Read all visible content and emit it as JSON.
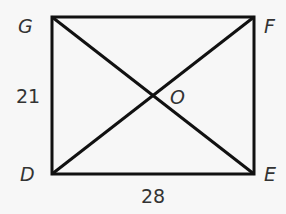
{
  "figure": {
    "type": "rectangle-with-diagonals",
    "vertices": {
      "G": {
        "label": "G",
        "x": 52,
        "y": 17
      },
      "F": {
        "label": "F",
        "x": 254,
        "y": 17
      },
      "E": {
        "label": "E",
        "x": 254,
        "y": 174
      },
      "D": {
        "label": "D",
        "x": 52,
        "y": 174
      }
    },
    "intersection": {
      "label": "O"
    },
    "measurements": {
      "side_GD": "21",
      "side_DE": "28"
    },
    "colors": {
      "stroke": "#111111",
      "text": "#333333",
      "background": "#f7f7f7"
    }
  }
}
